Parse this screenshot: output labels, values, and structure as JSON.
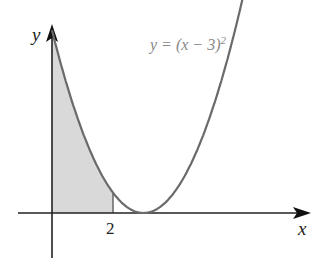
{
  "chart_data": {
    "type": "line",
    "title": "",
    "xlabel": "x",
    "ylabel": "y",
    "series": [
      {
        "name": "y = (x - 3)^2",
        "function": "(x-3)^2",
        "x": [
          0,
          1,
          2,
          3,
          4,
          5,
          6
        ],
        "values": [
          9,
          4,
          1,
          0,
          1,
          4,
          9
        ]
      }
    ],
    "shaded_region": {
      "from": 0,
      "to": 2,
      "under": "y = (x - 3)^2"
    },
    "x_ticks": [
      "2"
    ],
    "xlim": [
      -0.9,
      8.5
    ],
    "ylim": [
      -2.5,
      10.6
    ],
    "grid": false,
    "colors": {
      "curve": "#6a6a6a",
      "shade": "#d8d8d8",
      "axes": "#222222"
    }
  },
  "labels": {
    "x_axis": "x",
    "y_axis": "y",
    "curve": "y = (x − 3)",
    "curve_exp": "2",
    "tick_2": "2"
  }
}
